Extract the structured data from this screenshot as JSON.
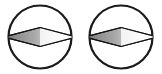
{
  "canvas": {
    "width": 162,
    "height": 74,
    "background": "#ffffff",
    "title": "paired-lens-symbols"
  },
  "style": {
    "circle_stroke": "#1a1a1a",
    "circle_stroke_width": 2.2,
    "circle_fill": "#ffffff",
    "diamond_stroke": "#111111",
    "diamond_stroke_width": 1.2,
    "diamond_fill_dark": "#8d8d8d",
    "diamond_fill_mid": "#b9b9b9",
    "diamond_fill_light": "#ffffff",
    "diamond_highlight": "#ffffff"
  },
  "figures": [
    {
      "id": "figure-left",
      "label": "left-lens-symbol",
      "circle": {
        "cx": 40.0,
        "cy": 37.0,
        "r": 31.5
      },
      "diamond": {
        "cx": 40.0,
        "cy": 37.0,
        "half_width": 36.0,
        "half_height": 9.5,
        "shading": "left-dark-to-right-light"
      }
    },
    {
      "id": "figure-right",
      "label": "right-lens-symbol",
      "circle": {
        "cx": 121.0,
        "cy": 37.0,
        "r": 31.5
      },
      "diamond": {
        "cx": 121.0,
        "cy": 37.0,
        "half_width": 36.0,
        "half_height": 9.5,
        "shading": "left-dark-to-right-light"
      }
    }
  ]
}
